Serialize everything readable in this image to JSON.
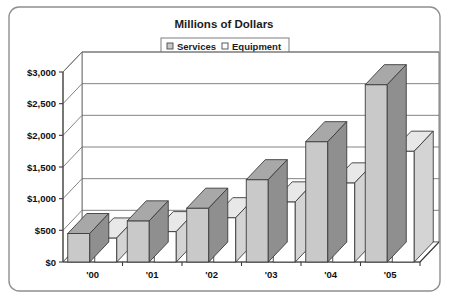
{
  "chart_data": {
    "type": "bar",
    "title": "Millions of Dollars",
    "subtitle": "",
    "xlabel": "",
    "ylabel": "",
    "categories": [
      "'00",
      "'01",
      "'02",
      "'03",
      "'04",
      "'05"
    ],
    "series": [
      {
        "name": "Services",
        "values": [
          450,
          650,
          850,
          1300,
          1900,
          2800
        ]
      },
      {
        "name": "Equipment",
        "values": [
          380,
          480,
          700,
          950,
          1250,
          1750
        ]
      }
    ],
    "ylim": [
      0,
      3000
    ],
    "ytick_labels": [
      "$0",
      "$500",
      "$1,000",
      "$1,500",
      "$2,000",
      "$2,500",
      "$3,000"
    ],
    "ytick_values": [
      0,
      500,
      1000,
      1500,
      2000,
      2500,
      3000
    ],
    "grid": true,
    "legend_position": "top-center",
    "style": "3d-column",
    "colors": {
      "services_face": "#c9c9c9",
      "services_top": "#a8a8a8",
      "services_side": "#8f8f8f",
      "equipment_face": "#ffffff",
      "equipment_top": "#e8e8e8",
      "equipment_side": "#d4d4d4",
      "outline": "#3c3c3c",
      "grid": "#6e6e6e",
      "axis": "#3d3d3d",
      "frame": "#8f8f8f",
      "text": "#101010"
    }
  },
  "legend": {
    "items": [
      {
        "label": "Services"
      },
      {
        "label": "Equipment"
      }
    ]
  }
}
